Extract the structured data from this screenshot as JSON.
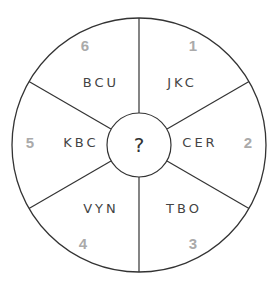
{
  "puzzle": {
    "center_label": "?",
    "segments": [
      {
        "number": "1",
        "code": "JKC"
      },
      {
        "number": "2",
        "code": "CER"
      },
      {
        "number": "3",
        "code": "TBO"
      },
      {
        "number": "4",
        "code": "VYN"
      },
      {
        "number": "5",
        "code": "KBC"
      },
      {
        "number": "6",
        "code": "BCU"
      }
    ]
  },
  "colors": {
    "line": "#333333",
    "code_text": "#444444",
    "number_text": "#aaaaaa"
  }
}
